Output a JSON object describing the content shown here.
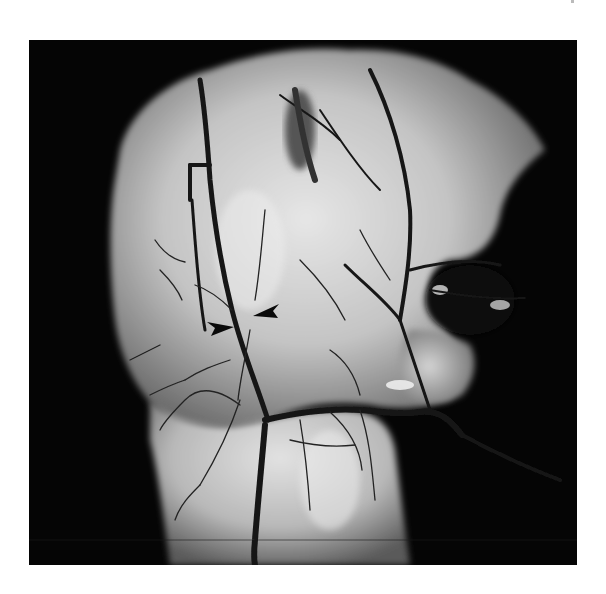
{
  "image": {
    "type": "grayscale anatomical specimen photograph",
    "description": "Dissected tissue specimen with injected dark branching vessels on pale tissue against a black background",
    "annotations": [
      {
        "kind": "arrowhead",
        "direction": "pointing-right",
        "x": 222,
        "y": 326
      },
      {
        "kind": "arrowhead",
        "direction": "pointing-left",
        "x": 268,
        "y": 312
      }
    ],
    "colors": {
      "background": "#050505",
      "tissue_light": "#d8d8d8",
      "tissue_mid": "#a8a8a8",
      "vessel": "#1a1a1a",
      "page": "#ffffff"
    }
  }
}
